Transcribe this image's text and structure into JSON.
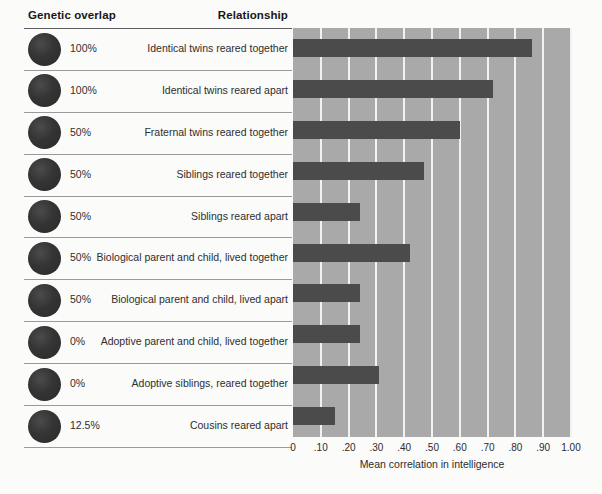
{
  "table": {
    "headers": {
      "genetic_overlap": "Genetic overlap",
      "relationship": "Relationship"
    },
    "rows": [
      {
        "genetic_overlap": "100%",
        "relationship": "Identical twins reared together"
      },
      {
        "genetic_overlap": "100%",
        "relationship": "Identical twins reared apart"
      },
      {
        "genetic_overlap": "50%",
        "relationship": "Fraternal twins reared together"
      },
      {
        "genetic_overlap": "50%",
        "relationship": "Siblings reared together"
      },
      {
        "genetic_overlap": "50%",
        "relationship": "Siblings reared apart"
      },
      {
        "genetic_overlap": "50%",
        "relationship": "Biological parent and child, lived together"
      },
      {
        "genetic_overlap": "50%",
        "relationship": "Biological parent and child, lived apart"
      },
      {
        "genetic_overlap": "0%",
        "relationship": "Adoptive parent and child, lived together"
      },
      {
        "genetic_overlap": "0%",
        "relationship": "Adoptive siblings, reared together"
      },
      {
        "genetic_overlap": "12.5%",
        "relationship": "Cousins reared apart"
      }
    ]
  },
  "colors": {
    "bar": "#4b4b4b",
    "plot_background": "#a9a9a9",
    "gridline": "#f2f2f0",
    "page_background": "#fbfbf9",
    "dot": "#343434"
  },
  "chart_data": {
    "type": "bar",
    "orientation": "horizontal",
    "title": "",
    "xlabel": "Mean correlation in intelligence",
    "ylabel": "",
    "xlim": [
      0,
      1.0
    ],
    "grid": true,
    "legend": "none",
    "tick_labels": [
      "0",
      ".10",
      ".20",
      ".30",
      ".40",
      ".50",
      ".60",
      ".70",
      ".80",
      ".90",
      "1.00"
    ],
    "tick_values": [
      0,
      0.1,
      0.2,
      0.3,
      0.4,
      0.5,
      0.6,
      0.7,
      0.8,
      0.9,
      1.0
    ],
    "categories": [
      "Identical twins reared together",
      "Identical twins reared apart",
      "Fraternal twins reared together",
      "Siblings reared together",
      "Siblings reared apart",
      "Biological parent and child, lived together",
      "Biological parent and child, lived apart",
      "Adoptive parent and child, lived together",
      "Adoptive siblings, reared together",
      "Cousins reared apart"
    ],
    "values": [
      0.86,
      0.72,
      0.6,
      0.47,
      0.24,
      0.42,
      0.24,
      0.24,
      0.31,
      0.15
    ],
    "genetic_overlap": [
      "100%",
      "100%",
      "50%",
      "50%",
      "50%",
      "50%",
      "50%",
      "0%",
      "0%",
      "12.5%"
    ]
  }
}
